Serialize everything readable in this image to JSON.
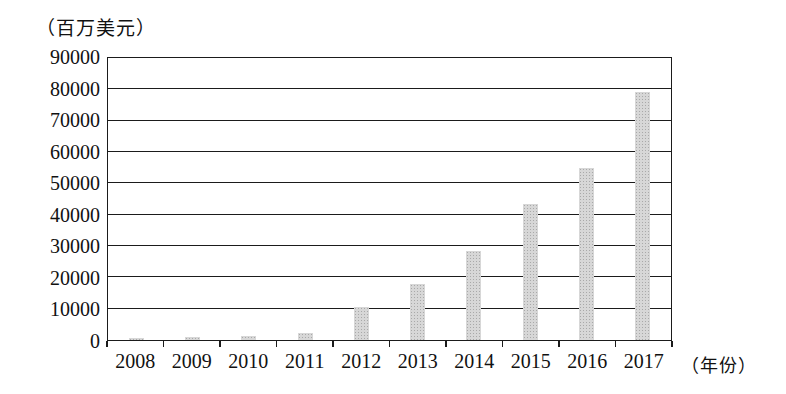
{
  "page": {
    "background_color": "#ffffff",
    "text_color": "#111111"
  },
  "chart_data": {
    "type": "bar",
    "title": "",
    "unit_label": "（百万美元）",
    "x_axis_label": "（年份）",
    "categories": [
      "2008",
      "2009",
      "2010",
      "2011",
      "2012",
      "2013",
      "2014",
      "2015",
      "2016",
      "2017"
    ],
    "values": [
      700,
      900,
      1300,
      2100,
      10400,
      18000,
      28500,
      43500,
      55000,
      79000
    ],
    "ylim": [
      0,
      90000
    ],
    "y_ticks": [
      0,
      10000,
      20000,
      30000,
      40000,
      50000,
      60000,
      70000,
      80000,
      90000
    ],
    "grid": "horizontal",
    "legend": "none",
    "bar_color": "#d7d7d7",
    "line_color": "#1b1b1b"
  }
}
